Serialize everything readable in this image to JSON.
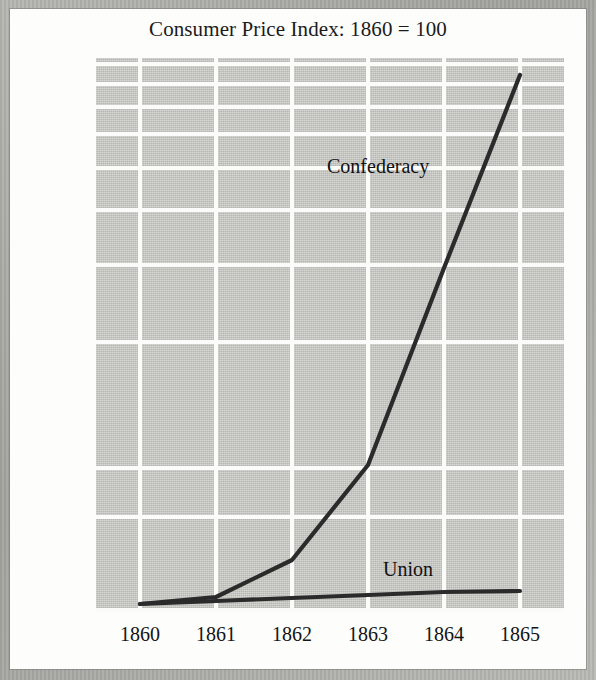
{
  "chart_data": {
    "type": "line",
    "title": "Consumer Price Index: 1860 = 100",
    "xlabel": "",
    "ylabel": "",
    "scale": "logarithmic",
    "grid": true,
    "legend": "inline-labels",
    "x": [
      1860,
      1861,
      1862,
      1863,
      1864,
      1865
    ],
    "categories": [
      "1860",
      "1861",
      "1862",
      "1863",
      "1864",
      "1865"
    ],
    "ylim": [
      0,
      10000
    ],
    "yticks": [
      0,
      1000,
      2000,
      3000,
      4000,
      5000,
      6000,
      7000,
      8000,
      9000,
      10000
    ],
    "ytick_labels": [
      "0",
      "1,000",
      "2,000",
      "3,000",
      "4,000",
      "5,000",
      "6,000",
      "7,000",
      "8,000",
      "9,000",
      "10,000"
    ],
    "series": [
      {
        "name": "Confederacy",
        "values": [
          180,
          290,
          600,
          1500,
          4000,
          9200
        ],
        "color": "#2b2b2b",
        "label_position": "upper-right"
      },
      {
        "name": "Union",
        "values": [
          180,
          195,
          210,
          230,
          250,
          250
        ],
        "color": "#2b2b2b",
        "label_position": "lower-right"
      }
    ]
  },
  "ytick_geometry": [
    {
      "label": "10,000",
      "y": 62
    },
    {
      "label": "9,000",
      "y": 82
    },
    {
      "label": "8,000",
      "y": 105
    },
    {
      "label": "7,000",
      "y": 132
    },
    {
      "label": "6,000",
      "y": 166
    },
    {
      "label": "5,000",
      "y": 208
    },
    {
      "label": "4,000",
      "y": 263
    },
    {
      "label": "3,000",
      "y": 340
    },
    {
      "label": "2,000",
      "y": 466
    },
    {
      "label": "1,000",
      "y": 515
    },
    {
      "label": "0",
      "y": 611
    }
  ],
  "xtick_geometry": [
    {
      "label": "1860",
      "x": 140
    },
    {
      "label": "1861",
      "x": 216
    },
    {
      "label": "1862",
      "x": 292
    },
    {
      "label": "1863",
      "x": 368
    },
    {
      "label": "1864",
      "x": 444
    },
    {
      "label": "1865",
      "x": 520
    }
  ],
  "gridlines_h": [
    62,
    82,
    105,
    132,
    166,
    208,
    263,
    340,
    466,
    515,
    608
  ],
  "gridlines_v": [
    140,
    216,
    292,
    368,
    444,
    520
  ],
  "paths": {
    "confederacy": "M140,604 L216,597 L292,560 L368,465 L444,268 L520,75",
    "union": "M140,604 L216,601 L292,598 L368,595 L444,592 L520,591"
  },
  "colors": {
    "page": "#fdfdfc",
    "scan_border": "#a3a39f",
    "plot_background": "#c9c9c5",
    "gridline": "#fbfbfa",
    "line": "#2b2b2b",
    "text": "#141414"
  }
}
